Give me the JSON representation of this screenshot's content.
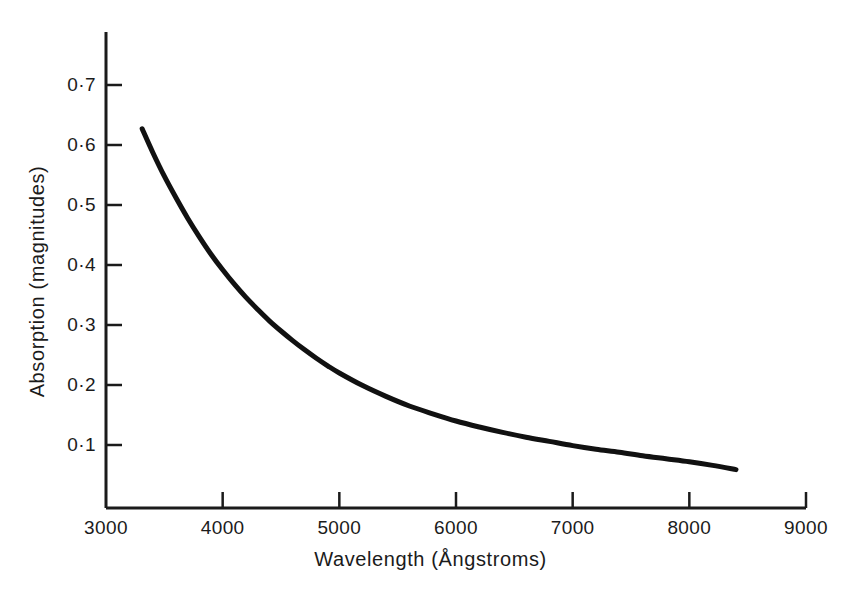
{
  "chart_data": {
    "type": "line",
    "title": "",
    "xlabel": "Wavelength (Ångstroms)",
    "ylabel": "Absorption (magnitudes)",
    "xlim": [
      3000,
      9000
    ],
    "ylim": [
      0,
      0.75
    ],
    "grid": false,
    "legend": null,
    "xticks": [
      3000,
      4000,
      5000,
      6000,
      7000,
      8000,
      9000
    ],
    "xtick_labels": [
      "3000",
      "4000",
      "5000",
      "6000",
      "7000",
      "8000",
      "9000"
    ],
    "yticks": [
      0.1,
      0.2,
      0.3,
      0.4,
      0.5,
      0.6,
      0.7
    ],
    "ytick_labels": [
      "0·1",
      "0·2",
      "0·3",
      "0·4",
      "0·5",
      "0·6",
      "0·7"
    ],
    "series": [
      {
        "name": "Absorption",
        "color": "#111111",
        "line_width": 5,
        "x": [
          3310,
          3400,
          3500,
          3600,
          3700,
          3800,
          3900,
          4000,
          4100,
          4200,
          4300,
          4400,
          4500,
          4600,
          4700,
          4800,
          4900,
          5000,
          5200,
          5400,
          5600,
          5800,
          6000,
          6200,
          6400,
          6600,
          6800,
          7000,
          7200,
          7400,
          7600,
          7800,
          8000,
          8200,
          8400
        ],
        "y": [
          0.627,
          0.588,
          0.548,
          0.512,
          0.478,
          0.447,
          0.418,
          0.392,
          0.368,
          0.346,
          0.326,
          0.307,
          0.29,
          0.274,
          0.259,
          0.245,
          0.232,
          0.22,
          0.199,
          0.181,
          0.165,
          0.152,
          0.14,
          0.13,
          0.121,
          0.113,
          0.106,
          0.099,
          0.093,
          0.088,
          0.082,
          0.077,
          0.072,
          0.066,
          0.059
        ]
      }
    ],
    "annotations": []
  },
  "axes": {
    "y_axis_name": "absorption-axis",
    "x_axis_name": "wavelength-axis",
    "tick_direction": "inward"
  }
}
